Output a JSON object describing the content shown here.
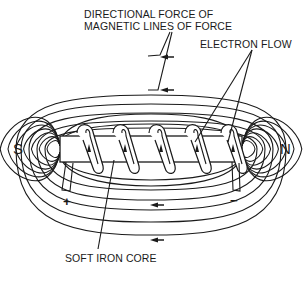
{
  "labels": {
    "directional_force_line1": "DIRECTIONAL FORCE OF",
    "directional_force_line2": "MAGNETIC LINES OF FORCE",
    "electron_flow": "ELECTRON FLOW",
    "soft_iron_core": "SOFT IRON CORE",
    "south_pole": "S",
    "north_pole": "N",
    "positive_terminal": "+",
    "negative_terminal": "−"
  },
  "coil_turns": 5,
  "colors": {
    "ink": "#1a1a1a",
    "background": "#ffffff"
  }
}
